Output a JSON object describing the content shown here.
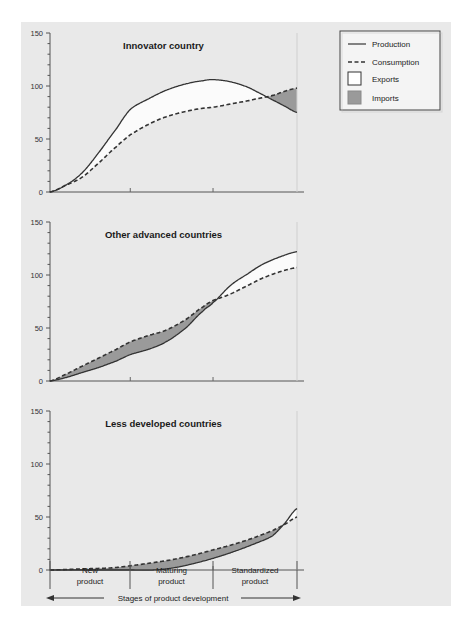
{
  "figure": {
    "background_color": "#e9e9e9",
    "page_color": "#ffffff",
    "line_color": "#333333",
    "imports_fill": "#9a9a9a",
    "exports_fill": "#fbfbfb"
  },
  "legend": {
    "items": [
      {
        "label": "Production",
        "marker": "solid-line"
      },
      {
        "label": "Consumption",
        "marker": "dashed-line"
      },
      {
        "label": "Exports",
        "marker": "white-swatch"
      },
      {
        "label": "Imports",
        "marker": "gray-swatch"
      }
    ]
  },
  "axis": {
    "y_ticks": [
      "150",
      "100",
      "50",
      "0"
    ],
    "y_minor_step": 10,
    "y_min": 0,
    "y_max": 150,
    "caption": "Stages of product development",
    "stages": [
      "New\nproduct",
      "Maturing\nproduct",
      "Standardized\nproduct"
    ],
    "stage_lines": [
      {
        "line1": "New",
        "line2": "product"
      },
      {
        "line1": "Maturing",
        "line2": "product"
      },
      {
        "line1": "Standardized",
        "line2": "product"
      }
    ]
  },
  "chart_data": {
    "type": "area",
    "xlabel": "Stages of product development",
    "ylabel": "",
    "ylim": [
      0,
      150
    ],
    "y_ticks": [
      0,
      50,
      100,
      150
    ],
    "x_stage_boundaries": [
      0,
      0.325,
      0.66,
      1.0
    ],
    "x_stage_names": [
      "New product",
      "Maturing product",
      "Standardized product"
    ],
    "grid": false,
    "legend_position": "top-right",
    "panels": [
      {
        "title": "Innovator country",
        "series": [
          {
            "name": "Production",
            "style": "solid",
            "x": [
              0.0,
              0.06,
              0.13,
              0.2,
              0.27,
              0.325,
              0.4,
              0.47,
              0.55,
              0.62,
              0.66,
              0.73,
              0.8,
              0.86,
              0.9,
              0.95,
              1.0
            ],
            "values": [
              0,
              6,
              18,
              38,
              60,
              78,
              88,
              96,
              102,
              105,
              106,
              104,
              99,
              92,
              87,
              81,
              75
            ]
          },
          {
            "name": "Consumption",
            "style": "dashed",
            "x": [
              0.0,
              0.06,
              0.13,
              0.2,
              0.27,
              0.325,
              0.4,
              0.47,
              0.55,
              0.62,
              0.66,
              0.73,
              0.8,
              0.86,
              0.9,
              0.95,
              1.0
            ],
            "values": [
              0,
              6,
              14,
              28,
              43,
              54,
              64,
              71,
              76,
              79,
              80,
              83,
              86,
              89,
              91,
              95,
              98
            ]
          }
        ],
        "fills": [
          {
            "name": "Exports",
            "type": "production-above-consumption"
          },
          {
            "name": "Imports",
            "type": "consumption-above-production"
          }
        ]
      },
      {
        "title": "Other advanced countries",
        "series": [
          {
            "name": "Production",
            "style": "solid",
            "x": [
              0.0,
              0.06,
              0.13,
              0.2,
              0.27,
              0.325,
              0.4,
              0.47,
              0.55,
              0.62,
              0.66,
              0.73,
              0.8,
              0.86,
              0.93,
              1.0
            ],
            "values": [
              0,
              3,
              8,
              13,
              19,
              25,
              30,
              37,
              50,
              66,
              74,
              90,
              101,
              110,
              117,
              122
            ]
          },
          {
            "name": "Consumption",
            "style": "dashed",
            "x": [
              0.0,
              0.06,
              0.13,
              0.2,
              0.27,
              0.325,
              0.4,
              0.47,
              0.55,
              0.62,
              0.66,
              0.73,
              0.8,
              0.86,
              0.93,
              1.0
            ],
            "values": [
              0,
              6,
              14,
              22,
              30,
              37,
              43,
              48,
              58,
              70,
              76,
              82,
              90,
              97,
              103,
              107
            ]
          }
        ],
        "fills": [
          {
            "name": "Imports",
            "type": "consumption-above-production"
          },
          {
            "name": "Exports",
            "type": "production-above-consumption"
          }
        ]
      },
      {
        "title": "Less developed  countries",
        "series": [
          {
            "name": "Production",
            "style": "solid",
            "x": [
              0.0,
              0.13,
              0.25,
              0.325,
              0.42,
              0.5,
              0.58,
              0.66,
              0.74,
              0.82,
              0.9,
              0.95,
              1.0
            ],
            "values": [
              0,
              0,
              0,
              0,
              0,
              2,
              6,
              11,
              17,
              24,
              32,
              44,
              58
            ]
          },
          {
            "name": "Consumption",
            "style": "dashed",
            "x": [
              0.0,
              0.13,
              0.25,
              0.325,
              0.42,
              0.5,
              0.58,
              0.66,
              0.74,
              0.82,
              0.9,
              0.95,
              1.0
            ],
            "values": [
              0,
              1,
              2,
              4,
              7,
              10,
              14,
              19,
              24,
              30,
              37,
              43,
              50
            ]
          }
        ],
        "fills": [
          {
            "name": "Imports",
            "type": "consumption-above-production"
          },
          {
            "name": "Exports",
            "type": "production-above-consumption"
          }
        ]
      }
    ]
  }
}
